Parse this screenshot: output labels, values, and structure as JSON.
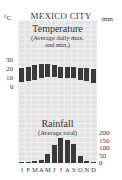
{
  "chart_data": [
    {
      "type": "bar",
      "subtype": "floating-range",
      "title": "Temperature",
      "subtitle": "(Average daily max. and min.)",
      "ylabel": "°C",
      "ylim": [
        0,
        30
      ],
      "yticks": [
        0,
        10,
        20,
        30
      ],
      "categories": [
        "J",
        "F",
        "M",
        "A",
        "M",
        "J",
        "J",
        "A",
        "S",
        "O",
        "N",
        "D"
      ],
      "series": [
        {
          "name": "min",
          "values": [
            6,
            7,
            9,
            11,
            12,
            12,
            11,
            11,
            11,
            9,
            7,
            5
          ]
        },
        {
          "name": "max",
          "values": [
            21,
            23,
            25,
            26,
            26,
            25,
            23,
            23,
            23,
            22,
            21,
            20
          ]
        }
      ],
      "grid": true
    },
    {
      "type": "bar",
      "title": "Rainfall",
      "subtitle": "(Average total)",
      "ylabel": "mm",
      "ylim": [
        0,
        200
      ],
      "yticks": [
        0,
        50,
        100,
        150,
        200
      ],
      "categories": [
        "J",
        "F",
        "M",
        "A",
        "M",
        "J",
        "J",
        "A",
        "S",
        "O",
        "N",
        "D"
      ],
      "values": [
        8,
        5,
        10,
        20,
        55,
        115,
        160,
        150,
        125,
        45,
        15,
        8
      ],
      "grid": true
    }
  ],
  "header": {
    "title": "MEXICO CITY",
    "left_unit": "°C",
    "right_unit": "mm"
  },
  "temperature": {
    "title": "Temperature",
    "subtitle_1": "(Average daily max.",
    "subtitle_2": "and min.)",
    "ticks": [
      "30",
      "20",
      "10",
      "0"
    ]
  },
  "rainfall": {
    "title": "Rainfall",
    "subtitle": "(Average total)",
    "ticks": [
      "200",
      "150",
      "100",
      "50",
      "0"
    ]
  },
  "months": [
    "J",
    "F",
    "M",
    "A",
    "M",
    "J",
    "J",
    "A",
    "S",
    "O",
    "N",
    "D"
  ],
  "colors": {
    "bar": "#3a3a3a",
    "panel": "#e3e3e3",
    "grid": "#f1f1f1"
  }
}
